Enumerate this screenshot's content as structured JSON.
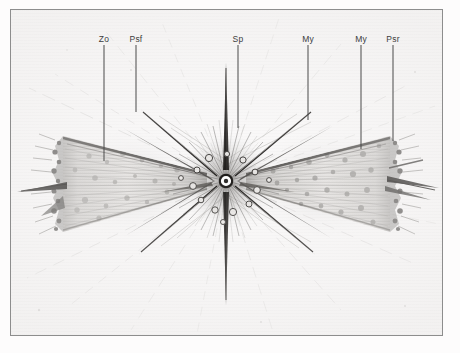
{
  "plate": {
    "background_color": "#fbfafa",
    "frame_color": "#8d8d8d",
    "ink_color": "#3c3c3c"
  },
  "figure": {
    "title": "",
    "center_nucleus": "",
    "left_shell": "",
    "right_shell": ""
  },
  "labels": [
    {
      "id": "zo",
      "text": "Zo",
      "x": 103,
      "y": 33,
      "leader_top": 44,
      "leader_height": 116
    },
    {
      "id": "psf",
      "text": "Psf",
      "x": 135,
      "y": 33,
      "leader_top": 44,
      "leader_height": 67
    },
    {
      "id": "sp",
      "text": "Sp",
      "x": 237,
      "y": 33,
      "leader_top": 44,
      "leader_height": 83
    },
    {
      "id": "my1",
      "text": "My",
      "x": 307,
      "y": 33,
      "leader_top": 44,
      "leader_height": 75
    },
    {
      "id": "my2",
      "text": "My",
      "x": 360,
      "y": 33,
      "leader_top": 44,
      "leader_height": 104
    },
    {
      "id": "psr",
      "text": "Psr",
      "x": 392,
      "y": 33,
      "leader_top": 44,
      "leader_height": 96
    }
  ]
}
